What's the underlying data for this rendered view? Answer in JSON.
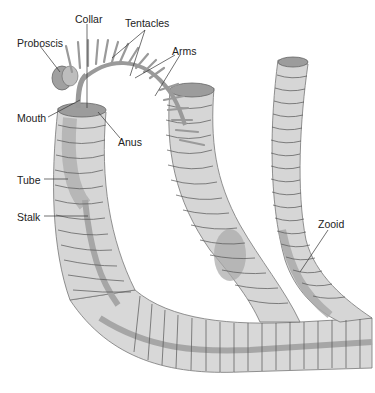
{
  "diagram": {
    "colors": {
      "tube_fill": "#d4d4d4",
      "tube_light": "#e4e4e4",
      "tube_ring": "#555555",
      "stalk": "#a8a8a8",
      "tentacle": "#9a9a9a",
      "label_text": "#222222",
      "leader_line": "#333333"
    },
    "labels": [
      {
        "id": "collar",
        "text": "Collar",
        "x": 75,
        "y": 14
      },
      {
        "id": "tentacles",
        "text": "Tentacles",
        "x": 125,
        "y": 18
      },
      {
        "id": "proboscis",
        "text": "Proboscis",
        "x": 17,
        "y": 38
      },
      {
        "id": "arms",
        "text": "Arms",
        "x": 172,
        "y": 46
      },
      {
        "id": "mouth",
        "text": "Mouth",
        "x": 17,
        "y": 113
      },
      {
        "id": "anus",
        "text": "Anus",
        "x": 118,
        "y": 137
      },
      {
        "id": "tube",
        "text": "Tube",
        "x": 17,
        "y": 175
      },
      {
        "id": "stalk",
        "text": "Stalk",
        "x": 17,
        "y": 212
      },
      {
        "id": "zooid",
        "text": "Zooid",
        "x": 318,
        "y": 219
      }
    ]
  }
}
